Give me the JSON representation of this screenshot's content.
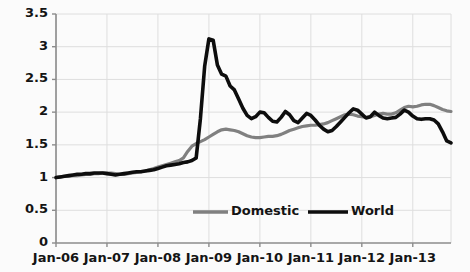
{
  "chart_data": {
    "type": "line",
    "title": "",
    "xlabel": "",
    "ylabel": "",
    "ylim": [
      0,
      3.5
    ],
    "yticks": [
      "0",
      "0.5",
      "1",
      "1.5",
      "2",
      "2.5",
      "3",
      "3.5"
    ],
    "ytick_values": [
      0,
      0.5,
      1,
      1.5,
      2,
      2.5,
      3,
      3.5
    ],
    "xticks": [
      "Jan-06",
      "Jan-07",
      "Jan-08",
      "Jan-09",
      "Jan-10",
      "Jan-11",
      "Jan-12",
      "Jan-13"
    ],
    "xtick_values": [
      0,
      12,
      24,
      36,
      48,
      60,
      72,
      84
    ],
    "xlim": [
      0,
      93
    ],
    "grid": true,
    "legend_position": "bottom-center-inside",
    "series": [
      {
        "name": "Domestic",
        "color": "#808080",
        "width": 3.2,
        "values": [
          1.0,
          1.01,
          1.02,
          1.02,
          1.03,
          1.03,
          1.04,
          1.05,
          1.05,
          1.06,
          1.06,
          1.07,
          1.07,
          1.07,
          1.06,
          1.05,
          1.05,
          1.06,
          1.07,
          1.08,
          1.09,
          1.1,
          1.12,
          1.14,
          1.16,
          1.18,
          1.2,
          1.22,
          1.24,
          1.26,
          1.3,
          1.4,
          1.48,
          1.52,
          1.55,
          1.58,
          1.62,
          1.66,
          1.7,
          1.73,
          1.74,
          1.73,
          1.72,
          1.7,
          1.67,
          1.64,
          1.62,
          1.61,
          1.61,
          1.62,
          1.63,
          1.63,
          1.64,
          1.66,
          1.69,
          1.72,
          1.74,
          1.76,
          1.78,
          1.79,
          1.8,
          1.8,
          1.81,
          1.82,
          1.84,
          1.87,
          1.9,
          1.93,
          1.96,
          1.97,
          1.96,
          1.94,
          1.93,
          1.92,
          1.93,
          1.95,
          1.97,
          1.98,
          1.97,
          1.97,
          1.99,
          2.03,
          2.07,
          2.09,
          2.08,
          2.09,
          2.11,
          2.12,
          2.12,
          2.1,
          2.07,
          2.04,
          2.02,
          2.01
        ]
      },
      {
        "name": "World",
        "color": "#0d0d0d",
        "width": 3.6,
        "values": [
          1.0,
          1.01,
          1.02,
          1.03,
          1.04,
          1.05,
          1.05,
          1.06,
          1.06,
          1.07,
          1.07,
          1.07,
          1.06,
          1.05,
          1.04,
          1.05,
          1.06,
          1.07,
          1.08,
          1.09,
          1.09,
          1.1,
          1.11,
          1.12,
          1.14,
          1.16,
          1.18,
          1.19,
          1.2,
          1.21,
          1.23,
          1.24,
          1.26,
          1.3,
          1.9,
          2.7,
          3.12,
          3.1,
          2.72,
          2.58,
          2.55,
          2.4,
          2.34,
          2.2,
          2.06,
          1.95,
          1.9,
          1.93,
          2.0,
          1.99,
          1.92,
          1.86,
          1.85,
          1.92,
          2.01,
          1.96,
          1.87,
          1.84,
          1.91,
          1.98,
          1.95,
          1.88,
          1.8,
          1.74,
          1.7,
          1.72,
          1.78,
          1.85,
          1.92,
          1.99,
          2.05,
          2.03,
          1.97,
          1.91,
          1.93,
          2.0,
          1.95,
          1.91,
          1.9,
          1.91,
          1.92,
          1.97,
          2.03,
          2.0,
          1.94,
          1.9,
          1.89,
          1.9,
          1.9,
          1.88,
          1.82,
          1.7,
          1.56,
          1.53
        ]
      }
    ]
  },
  "legend": {
    "items": [
      {
        "label": "Domestic",
        "color": "#808080"
      },
      {
        "label": "World",
        "color": "#0d0d0d"
      }
    ]
  },
  "axes": {
    "axis_color": "#8c8c8c",
    "grid_color": "#dedede",
    "tick_color": "#8c8c8c"
  }
}
